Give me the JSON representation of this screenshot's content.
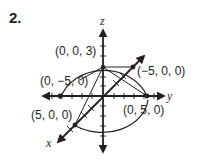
{
  "problem_number": "2.",
  "diagram": {
    "type": "3d-coordinate-axes",
    "axes": {
      "x": "x",
      "y": "y",
      "z": "z"
    },
    "points": [
      {
        "label": "(0, 0, 3)",
        "coords": [
          0,
          0,
          3
        ]
      },
      {
        "label": "(0, −5, 0)",
        "coords": [
          0,
          -5,
          0
        ]
      },
      {
        "label": "(−5, 0, 0)",
        "coords": [
          -5,
          0,
          0
        ]
      },
      {
        "label": "(5, 0, 0)",
        "coords": [
          5,
          0,
          0
        ]
      },
      {
        "label": "(0, 5, 0)",
        "coords": [
          0,
          5,
          0
        ]
      }
    ],
    "color": "#231f20"
  }
}
